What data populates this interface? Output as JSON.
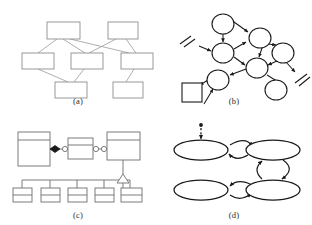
{
  "figure": {
    "background_color": "#ffffff",
    "line_color_light": "#9a9a9a",
    "line_color_dark": "#1a1a1a",
    "fill_color": "#ffffff",
    "panel_count": 4
  },
  "panels": [
    {
      "id": "a",
      "caption": "(a)",
      "type": "layered-box-graph",
      "node_shape": "rectangle",
      "node_count": 7,
      "edge_count": 8,
      "edge_style": "straight-thin",
      "stroke": "#9a9a9a",
      "nodes": [
        {
          "name": "a-node-1",
          "x": 47,
          "y": 22,
          "w": 33,
          "h": 17
        },
        {
          "name": "a-node-2",
          "x": 108,
          "y": 22,
          "w": 30,
          "h": 17
        },
        {
          "name": "a-node-3",
          "x": 22,
          "y": 53,
          "w": 32,
          "h": 16
        },
        {
          "name": "a-node-4",
          "x": 71,
          "y": 53,
          "w": 32,
          "h": 16
        },
        {
          "name": "a-node-5",
          "x": 121,
          "y": 53,
          "w": 32,
          "h": 16
        },
        {
          "name": "a-node-6",
          "x": 55,
          "y": 82,
          "w": 32,
          "h": 16
        },
        {
          "name": "a-node-7",
          "x": 113,
          "y": 82,
          "w": 30,
          "h": 16
        }
      ],
      "edges": [
        {
          "from": "a-node-1",
          "to": "a-node-3"
        },
        {
          "from": "a-node-1",
          "to": "a-node-4"
        },
        {
          "from": "a-node-1",
          "to": "a-node-5"
        },
        {
          "from": "a-node-2",
          "to": "a-node-4"
        },
        {
          "from": "a-node-2",
          "to": "a-node-5"
        },
        {
          "from": "a-node-3",
          "to": "a-node-6"
        },
        {
          "from": "a-node-4",
          "to": "a-node-6"
        },
        {
          "from": "a-node-5",
          "to": "a-node-7"
        }
      ]
    },
    {
      "id": "b",
      "caption": "(b)",
      "type": "directed-graph",
      "node_shape": "ellipse-and-square",
      "node_count": 7,
      "edge_count": 11,
      "edge_style": "arrow",
      "stroke": "#1a1a1a",
      "has_cut_markers": true,
      "cut_marker_count": 2,
      "nodes": [
        {
          "name": "b-ellipse-1",
          "cx": 67,
          "cy": 24,
          "rx": 11,
          "ry": 10,
          "shape": "ellipse"
        },
        {
          "name": "b-ellipse-2",
          "cx": 67,
          "cy": 53,
          "rx": 11,
          "ry": 10,
          "shape": "ellipse"
        },
        {
          "name": "b-ellipse-3",
          "cx": 104,
          "cy": 38,
          "rx": 11,
          "ry": 10,
          "shape": "ellipse"
        },
        {
          "name": "b-ellipse-4",
          "cx": 127,
          "cy": 53,
          "rx": 11,
          "ry": 10,
          "shape": "ellipse"
        },
        {
          "name": "b-ellipse-5",
          "cx": 101,
          "cy": 68,
          "rx": 11,
          "ry": 10,
          "shape": "ellipse"
        },
        {
          "name": "b-ellipse-6",
          "cx": 62,
          "cy": 80,
          "rx": 11,
          "ry": 10,
          "shape": "ellipse"
        },
        {
          "name": "b-ellipse-7",
          "cx": 120,
          "cy": 90,
          "rx": 11,
          "ry": 10,
          "shape": "ellipse"
        },
        {
          "name": "b-square-1",
          "x": 26,
          "y": 83,
          "w": 20,
          "h": 19,
          "shape": "square"
        }
      ],
      "cut_markers": [
        {
          "name": "b-cut-marker-left",
          "x": 30,
          "y": 42
        },
        {
          "name": "b-cut-marker-right",
          "x": 140,
          "y": 76
        }
      ]
    },
    {
      "id": "c",
      "caption": "(c)",
      "type": "uml-class-diagram",
      "class_box_count": 3,
      "leaf_box_count": 5,
      "stroke": "#6e6e6e",
      "connectors": [
        {
          "name": "composition-diamond",
          "shape": "filled-diamond"
        },
        {
          "name": "ball-socket-1",
          "shape": "hollow-circle"
        },
        {
          "name": "ball-socket-2",
          "shape": "hollow-circle"
        },
        {
          "name": "ball-socket-3",
          "shape": "hollow-circle"
        },
        {
          "name": "generalization-triangle",
          "shape": "hollow-triangle"
        }
      ],
      "class_boxes": [
        {
          "name": "c-class-1",
          "x": 18,
          "y": 20,
          "w": 32,
          "h": 34,
          "header_h": 8
        },
        {
          "name": "c-class-2",
          "x": 68,
          "y": 26,
          "w": 25,
          "h": 21,
          "header_h": 7
        },
        {
          "name": "c-class-3",
          "x": 107,
          "y": 20,
          "w": 33,
          "h": 28,
          "header_h": 8
        }
      ],
      "leaf_boxes": [
        {
          "name": "c-leaf-1",
          "x": 13,
          "y": 76,
          "w": 19,
          "h": 14
        },
        {
          "name": "c-leaf-2",
          "x": 41,
          "y": 76,
          "w": 19,
          "h": 14
        },
        {
          "name": "c-leaf-3",
          "x": 68,
          "y": 76,
          "w": 19,
          "h": 14
        },
        {
          "name": "c-leaf-4",
          "x": 95,
          "y": 76,
          "w": 19,
          "h": 14
        },
        {
          "name": "c-leaf-5",
          "x": 121,
          "y": 76,
          "w": 21,
          "h": 14
        }
      ]
    },
    {
      "id": "d",
      "caption": "(d)",
      "type": "state-machine",
      "node_shape": "wide-ellipse",
      "node_count": 4,
      "stroke": "#1a1a1a",
      "has_initial_marker": true,
      "initial_marker_style": "dashed-arrow-with-dot",
      "transition_count": 4,
      "transition_style": "curved-arc-arrow",
      "nodes": [
        {
          "name": "d-state-1",
          "cx": 45,
          "cy": 38,
          "rx": 27,
          "ry": 10
        },
        {
          "name": "d-state-2",
          "cx": 117,
          "cy": 38,
          "rx": 27,
          "ry": 10
        },
        {
          "name": "d-state-3",
          "cx": 45,
          "cy": 78,
          "rx": 27,
          "ry": 10
        },
        {
          "name": "d-state-4",
          "cx": 117,
          "cy": 78,
          "rx": 27,
          "ry": 10
        }
      ],
      "transitions": [
        {
          "name": "d-transition-top",
          "from": "d-state-1",
          "to": "d-state-2",
          "direction": "bidirectional"
        },
        {
          "name": "d-transition-right",
          "from": "d-state-2",
          "to": "d-state-4",
          "direction": "bidirectional"
        },
        {
          "name": "d-transition-bottom",
          "from": "d-state-3",
          "to": "d-state-4",
          "direction": "bidirectional"
        },
        {
          "name": "d-initial",
          "from": "start",
          "to": "d-state-1",
          "direction": "in"
        }
      ]
    }
  ]
}
